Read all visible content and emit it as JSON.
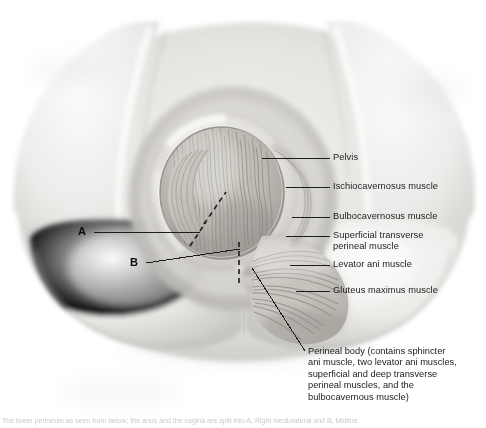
{
  "figure": {
    "background_color": "#ffffff",
    "line_color": "#1c1c1c"
  },
  "callouts": [
    {
      "id": "pelvis",
      "label": "Pelvis"
    },
    {
      "id": "ischiocavernosus",
      "label": "Ischiocavernosus muscle"
    },
    {
      "id": "bulbocavernosus",
      "label": "Bulbocavernosus muscle"
    },
    {
      "id": "superficial-transverse-line1",
      "label": "Superficial transverse"
    },
    {
      "id": "superficial-transverse-line2",
      "label": "perineal muscle"
    },
    {
      "id": "levator-ani",
      "label": "Levator ani muscle"
    },
    {
      "id": "gluteus-maximus",
      "label": "Gluteus maximus muscle"
    }
  ],
  "markers": [
    {
      "id": "marker-a",
      "label": "A"
    },
    {
      "id": "marker-b",
      "label": "B"
    }
  ],
  "caption": {
    "lines": [
      "Perineal body (contains sphincter",
      "ani muscle, two levator ani muscles,",
      "superficial and deep transverse",
      "perineal muscles, and the",
      "bulbocavernous muscle)"
    ]
  },
  "source_note": {
    "text": "The lower perineum as seen from below; the anus and the vagina are split into A, Right mediolateral and B, Midline"
  }
}
